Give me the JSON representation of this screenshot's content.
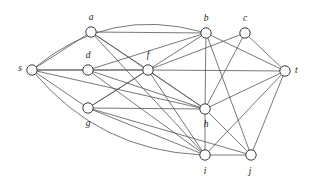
{
  "figure": {
    "background_color": "#ffffff",
    "edge_color": "#55545a",
    "node_fill_color": "#ffffff",
    "node_stroke_color": "#3b3b40",
    "label_color": "#1d1d20",
    "node_radius": 5.2
  },
  "graph_data": {
    "type": "node-link-diagram",
    "directed": false,
    "node_count": 10,
    "edge_count": 35,
    "nodes": [
      {
        "id": "s",
        "label": "s",
        "x": 32,
        "y": 70,
        "label_x": 22,
        "label_y": 69,
        "label_anchor": "end"
      },
      {
        "id": "a",
        "label": "a",
        "x": 91,
        "y": 32,
        "label_x": 91,
        "label_y": 18,
        "label_anchor": "middle"
      },
      {
        "id": "b",
        "label": "b",
        "x": 206,
        "y": 33,
        "label_x": 206,
        "label_y": 19,
        "label_anchor": "middle"
      },
      {
        "id": "c",
        "label": "c",
        "x": 245,
        "y": 33,
        "label_x": 245,
        "label_y": 19,
        "label_anchor": "middle"
      },
      {
        "id": "d",
        "label": "d",
        "x": 88,
        "y": 70,
        "label_x": 88,
        "label_y": 56,
        "label_anchor": "middle"
      },
      {
        "id": "f",
        "label": "f",
        "x": 148,
        "y": 70,
        "label_x": 148,
        "label_y": 56,
        "label_anchor": "middle"
      },
      {
        "id": "t",
        "label": "t",
        "x": 285,
        "y": 71,
        "label_x": 295,
        "label_y": 71,
        "label_anchor": "start"
      },
      {
        "id": "g",
        "label": "g",
        "x": 88,
        "y": 108,
        "label_x": 88,
        "label_y": 124,
        "label_anchor": "middle"
      },
      {
        "id": "h",
        "label": "h",
        "x": 205,
        "y": 109,
        "label_x": 206,
        "label_y": 125,
        "label_anchor": "middle"
      },
      {
        "id": "i",
        "label": "i",
        "x": 205,
        "y": 155,
        "label_x": 205,
        "label_y": 172,
        "label_anchor": "middle"
      },
      {
        "id": "j",
        "label": "j",
        "x": 251,
        "y": 155,
        "label_x": 250,
        "label_y": 172,
        "label_anchor": "middle"
      }
    ],
    "edges": [
      {
        "from": "s",
        "to": "b",
        "shape": "arc",
        "curve": -46
      },
      {
        "from": "s",
        "to": "a",
        "shape": "line"
      },
      {
        "from": "s",
        "to": "d",
        "shape": "line"
      },
      {
        "from": "s",
        "to": "f",
        "shape": "line"
      },
      {
        "from": "s",
        "to": "h",
        "shape": "line"
      },
      {
        "from": "s",
        "to": "g",
        "shape": "line"
      },
      {
        "from": "s",
        "to": "i",
        "shape": "arc",
        "curve": 42
      },
      {
        "from": "a",
        "to": "b",
        "shape": "line"
      },
      {
        "from": "a",
        "to": "f",
        "shape": "line"
      },
      {
        "from": "a",
        "to": "h",
        "shape": "line"
      },
      {
        "from": "a",
        "to": "i",
        "shape": "line"
      },
      {
        "from": "d",
        "to": "f",
        "shape": "line"
      },
      {
        "from": "d",
        "to": "b",
        "shape": "line"
      },
      {
        "from": "d",
        "to": "h",
        "shape": "line"
      },
      {
        "from": "d",
        "to": "i",
        "shape": "line"
      },
      {
        "from": "f",
        "to": "b",
        "shape": "line"
      },
      {
        "from": "f",
        "to": "t",
        "shape": "line"
      },
      {
        "from": "f",
        "to": "h",
        "shape": "line"
      },
      {
        "from": "f",
        "to": "g",
        "shape": "line"
      },
      {
        "from": "f",
        "to": "i",
        "shape": "line"
      },
      {
        "from": "b",
        "to": "t",
        "shape": "line"
      },
      {
        "from": "b",
        "to": "h",
        "shape": "line"
      },
      {
        "from": "b",
        "to": "j",
        "shape": "line"
      },
      {
        "from": "c",
        "to": "t",
        "shape": "line"
      },
      {
        "from": "c",
        "to": "h",
        "shape": "line"
      },
      {
        "from": "c",
        "to": "f",
        "shape": "line"
      },
      {
        "from": "g",
        "to": "h",
        "shape": "line"
      },
      {
        "from": "g",
        "to": "i",
        "shape": "line"
      },
      {
        "from": "g",
        "to": "j",
        "shape": "line"
      },
      {
        "from": "g",
        "to": "f",
        "shape": "line"
      },
      {
        "from": "h",
        "to": "t",
        "shape": "line"
      },
      {
        "from": "h",
        "to": "i",
        "shape": "line"
      },
      {
        "from": "h",
        "to": "j",
        "shape": "line"
      },
      {
        "from": "i",
        "to": "j",
        "shape": "line"
      },
      {
        "from": "i",
        "to": "t",
        "shape": "line"
      },
      {
        "from": "j",
        "to": "t",
        "shape": "line"
      }
    ]
  }
}
